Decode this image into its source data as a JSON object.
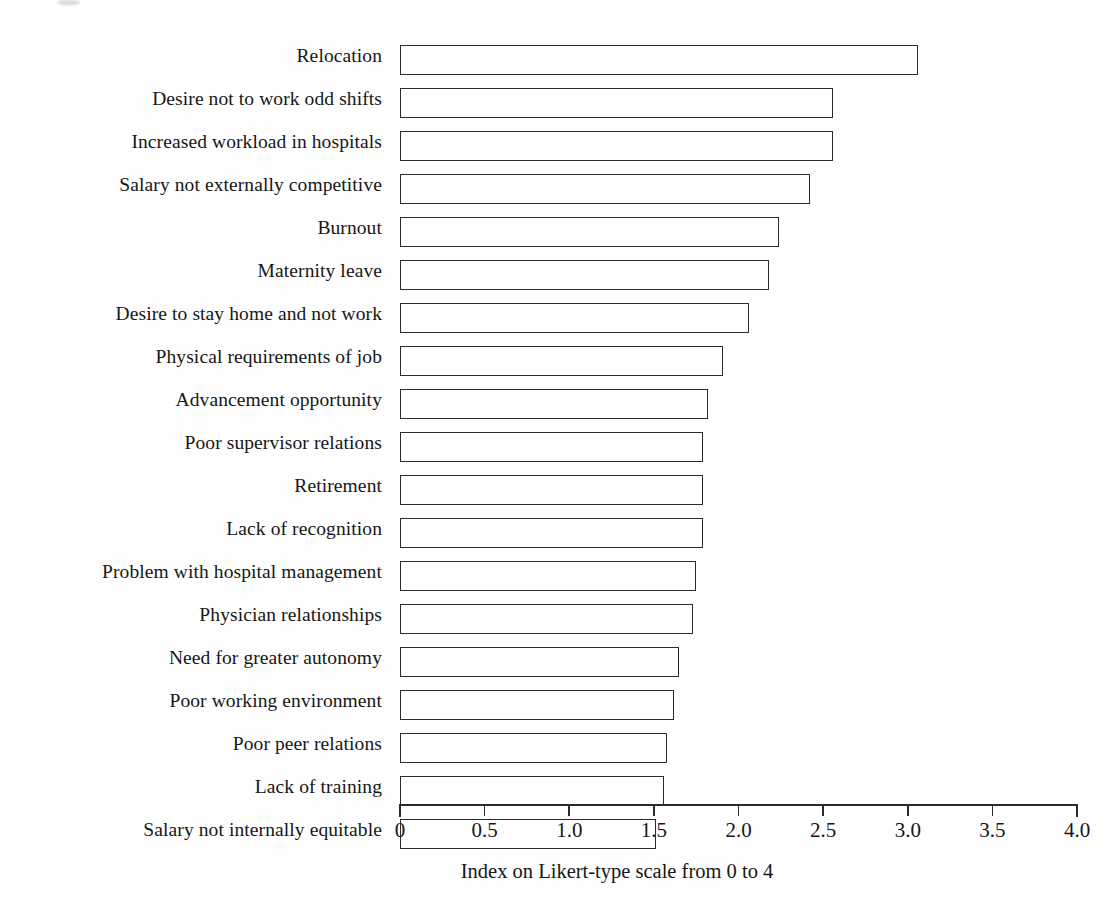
{
  "chart_data": {
    "type": "bar",
    "orientation": "horizontal",
    "title": "",
    "xlabel": "Index on Likert-type scale from 0 to 4",
    "ylabel": "",
    "xlim": [
      0,
      4
    ],
    "xticks": [
      "0",
      "0.5",
      "1.0",
      "1.5",
      "2.0",
      "2.5",
      "3.0",
      "3.5",
      "4.0"
    ],
    "xtick_values": [
      0,
      0.5,
      1.0,
      1.5,
      2.0,
      2.5,
      3.0,
      3.5,
      4.0
    ],
    "grid": false,
    "legend": null,
    "bar_style": {
      "fill": "#ffffff",
      "edge": "#2b2b2b"
    },
    "categories": [
      "Relocation",
      "Desire not to work odd shifts",
      "Increased workload in hospitals",
      "Salary not externally competitive",
      "Burnout",
      "Maternity leave",
      "Desire to stay home and not work",
      "Physical requirements of job",
      "Advancement opportunity",
      "Poor supervisor relations",
      "Retirement",
      "Lack of recognition",
      "Problem with hospital management",
      "Physician relationships",
      "Need for greater autonomy",
      "Poor working environment",
      "Poor peer relations",
      "Lack of training",
      "Salary not internally equitable"
    ],
    "values": [
      3.06,
      2.56,
      2.56,
      2.42,
      2.24,
      2.18,
      2.06,
      1.91,
      1.82,
      1.79,
      1.79,
      1.79,
      1.75,
      1.73,
      1.65,
      1.62,
      1.58,
      1.56,
      1.51
    ]
  }
}
